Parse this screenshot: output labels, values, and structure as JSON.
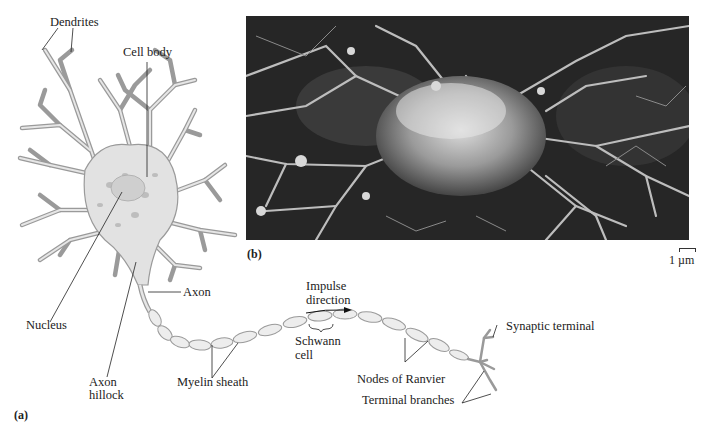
{
  "figure": {
    "panel_a_tag": "(a)",
    "panel_b_tag": "(b)",
    "scale_bar": "1 µm"
  },
  "labels": {
    "dendrites": "Dendrites",
    "cell_body": "Cell body",
    "nucleus": "Nucleus",
    "axon": "Axon",
    "axon_hillock_line1": "Axon",
    "axon_hillock_line2": "hillock",
    "myelin_sheath": "Myelin sheath",
    "impulse_line1": "Impulse",
    "impulse_line2": "direction",
    "schwann_line1": "Schwann",
    "schwann_line2": "cell",
    "nodes_of_ranvier": "Nodes of Ranvier",
    "synaptic_terminal": "Synaptic terminal",
    "terminal_branches": "Terminal branches"
  },
  "colors": {
    "line": "#222222",
    "neuron_fill": "#e4e4e4",
    "neuron_stroke": "#9a9a9a",
    "photo_dark": "#1e1e1e"
  }
}
